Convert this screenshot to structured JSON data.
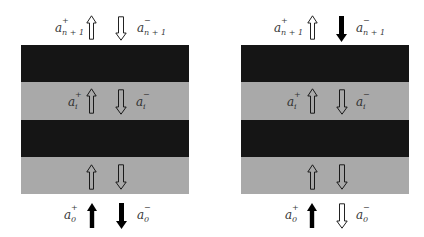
{
  "figure": {
    "colors": {
      "dark_layer": "#151515",
      "light_layer": "#a9a9a9",
      "background": "#ffffff",
      "arrow_filled": "#000000",
      "arrow_outline": "#222222"
    },
    "panels": [
      {
        "id": "left",
        "labels": {
          "top_plus": {
            "sym": "a",
            "sup": "+",
            "sub": "n + 1"
          },
          "top_minus": {
            "sym": "a",
            "sup": "−",
            "sub": "n + 1"
          },
          "mid_plus": {
            "sym": "a",
            "sup": "+",
            "sub": "i"
          },
          "mid_minus": {
            "sym": "a",
            "sup": "−",
            "sub": "i"
          },
          "bot_plus": {
            "sym": "a",
            "sup": "+",
            "sub": "0"
          },
          "bot_minus": {
            "sym": "a",
            "sup": "−",
            "sub": "0"
          }
        },
        "arrows": {
          "top_up": "outline",
          "top_down": "outline",
          "layer2_up": "outline",
          "layer2_down": "outline",
          "layer4_up": "outline",
          "layer4_down": "outline",
          "bot_up": "filled",
          "bot_down": "filled"
        }
      },
      {
        "id": "right",
        "labels": {
          "top_plus": {
            "sym": "a",
            "sup": "+",
            "sub": "n + 1"
          },
          "top_minus": {
            "sym": "a",
            "sup": "−",
            "sub": "n + 1"
          },
          "mid_plus": {
            "sym": "a",
            "sup": "+",
            "sub": "i"
          },
          "mid_minus": {
            "sym": "a",
            "sup": "−",
            "sub": "i"
          },
          "bot_plus": {
            "sym": "a",
            "sup": "+",
            "sub": "0"
          },
          "bot_minus": {
            "sym": "a",
            "sup": "−",
            "sub": "0"
          }
        },
        "arrows": {
          "top_up": "outline",
          "top_down": "filled",
          "layer2_up": "outline",
          "layer2_down": "outline",
          "layer4_up": "outline",
          "layer4_down": "outline",
          "bot_up": "filled",
          "bot_down": "outline"
        }
      }
    ],
    "layers": [
      "dark",
      "light",
      "dark",
      "light"
    ]
  }
}
